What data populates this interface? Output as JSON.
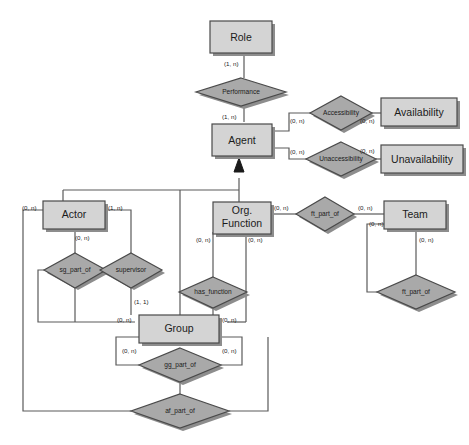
{
  "diagram": {
    "type": "entity-relationship-diagram",
    "colors": {
      "entity_fill": "#d4d4d4",
      "relationship_fill": "#a9a9a9",
      "stroke": "#4a4a4a",
      "shadow": "#8d8d8d",
      "background": "#ffffff",
      "text": "#1b1b1b"
    },
    "entities": [
      {
        "id": "role",
        "label": "Role"
      },
      {
        "id": "agent",
        "label": "Agent"
      },
      {
        "id": "availability",
        "label": "Availability"
      },
      {
        "id": "unavailability",
        "label": "Unavailability"
      },
      {
        "id": "actor",
        "label": "Actor"
      },
      {
        "id": "org_function",
        "label": "Org.\nFunction",
        "line1": "Org.",
        "line2": "Function"
      },
      {
        "id": "team",
        "label": "Team"
      },
      {
        "id": "group",
        "label": "Group"
      }
    ],
    "relationships": [
      {
        "id": "performance",
        "label": "Performance"
      },
      {
        "id": "accessibility",
        "label": "Accessibility"
      },
      {
        "id": "unaccessibility",
        "label": "Unaccessibility"
      },
      {
        "id": "sg_part_of",
        "label": "sg_part_of"
      },
      {
        "id": "supervisor",
        "label": "supervisor"
      },
      {
        "id": "has_function",
        "label": "has_function"
      },
      {
        "id": "ft_part_of_team",
        "label": "ft_part_of"
      },
      {
        "id": "ft_part_of_rec",
        "label": "ft_part_of"
      },
      {
        "id": "gg_part_of",
        "label": "gg_part_of"
      },
      {
        "id": "af_part_of",
        "label": "af_part_of"
      }
    ],
    "cardinalities": {
      "role_performance": "(1, n)",
      "performance_agent": "(1, n)",
      "agent_accessibility": "(0, n)",
      "accessibility_availability": "(0, n)",
      "agent_unaccessibility": "(0, n)",
      "unaccessibility_unavail": "(0, n)",
      "actor_left": "(0, n)",
      "actor_right": "(1, n)",
      "actor_bottom": "(0, n)",
      "orgfn_left": "(0, n)",
      "orgfn_right": "(0, n)",
      "orgfn_ftpartof": "(0, n)",
      "ftpartof_team": "(0, n)",
      "team_left": "(0, n)",
      "team_bottom": "(0, n)",
      "supervisor_group": "(1, 1)",
      "group_left": "(0, n)",
      "group_right": "(0, n)",
      "group_bottom_left": "(0, n)",
      "group_bottom_right": "(0, n)"
    },
    "notation": {
      "isa_symbol": "solid-triangle-arrowhead",
      "isa_description": "Agent generalizes Actor, Group and Org. Function"
    }
  }
}
